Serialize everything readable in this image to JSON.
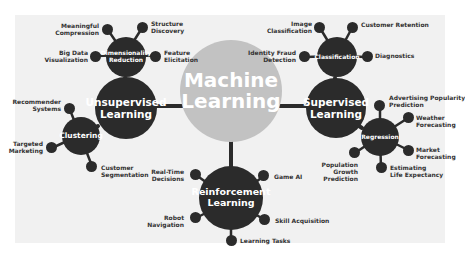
{
  "diagram": {
    "title": "Machine Learning",
    "center": {
      "line1": "Machine",
      "line2": "Learning"
    },
    "colors": {
      "panel": "#f1f1f1",
      "center": "#c2c2c2",
      "node": "#2b2b2b",
      "node_text": "#ffffff",
      "label_text": "#333333"
    },
    "branches": {
      "unsupervised": {
        "line1": "Unsupervised",
        "line2": "Learning",
        "dimensionality": {
          "line1": "Dimensionality",
          "line2": "Reduction",
          "leaves": [
            {
              "line1": "Meaningful",
              "line2": "Compression"
            },
            {
              "line1": "Structure",
              "line2": "Discovery"
            },
            {
              "line1": "Big Data",
              "line2": "Visualization"
            },
            {
              "line1": "Feature",
              "line2": "Elicitation"
            }
          ]
        },
        "clustering": {
          "label": "Clustering",
          "leaves": [
            {
              "line1": "Recommender",
              "line2": "Systems"
            },
            {
              "line1": "Targeted",
              "line2": "Marketing"
            },
            {
              "line1": "Customer",
              "line2": "Segmentation"
            }
          ]
        }
      },
      "supervised": {
        "line1": "Supervised",
        "line2": "Learning",
        "classification": {
          "label": "Classification",
          "leaves": [
            {
              "line1": "Image",
              "line2": "Classification"
            },
            {
              "line1": "Customer Retention",
              "line2": ""
            },
            {
              "line1": "Identity Fraud",
              "line2": "Detection"
            },
            {
              "line1": "Diagnostics",
              "line2": ""
            }
          ]
        },
        "regression": {
          "label": "Regression",
          "leaves": [
            {
              "line1": "Advertising Popularity",
              "line2": "Prediction"
            },
            {
              "line1": "Weather",
              "line2": "Forecasting"
            },
            {
              "line1": "Market",
              "line2": "Forecasting"
            },
            {
              "line1": "Estimating",
              "line2": "Life Expectancy"
            },
            {
              "line1": "Population",
              "line2": "Growth",
              "line3": "Prediction"
            }
          ]
        }
      },
      "reinforcement": {
        "line1": "Reinforcement",
        "line2": "Learning",
        "leaves": [
          {
            "line1": "Real-Time",
            "line2": "Decisions"
          },
          {
            "line1": "Game AI",
            "line2": ""
          },
          {
            "line1": "Robot",
            "line2": "Navigation"
          },
          {
            "line1": "Skill Acquisition",
            "line2": ""
          },
          {
            "line1": "Learning Tasks",
            "line2": ""
          }
        ]
      }
    }
  }
}
